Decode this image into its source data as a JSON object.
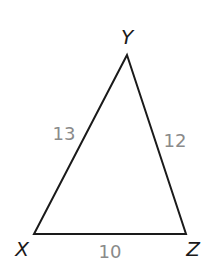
{
  "diagram": {
    "type": "triangle",
    "vertices": [
      {
        "id": "Y",
        "label": "Y",
        "x": 127,
        "y": 55
      },
      {
        "id": "X",
        "label": "X",
        "x": 34,
        "y": 234
      },
      {
        "id": "Z",
        "label": "Z",
        "x": 186,
        "y": 234
      }
    ],
    "sides": [
      {
        "id": "XY",
        "label": "13"
      },
      {
        "id": "YZ",
        "label": "12"
      },
      {
        "id": "XZ",
        "label": "10"
      }
    ],
    "colors": {
      "stroke": "#1a1a1a",
      "vertex_label": "#1a1a1a",
      "side_label": "#8a8a8a",
      "background": "#ffffff"
    }
  }
}
